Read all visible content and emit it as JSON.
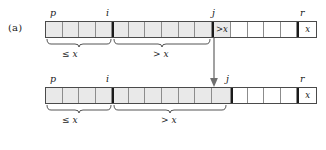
{
  "figure": {
    "part_label": "(a)",
    "caption_text": ""
  },
  "colors": {
    "shaded_cell": "#e9e9e9",
    "plain_cell": "#ffffff",
    "array_border": "#4a4a4a",
    "cell_divider": "#8c8c8c",
    "bold_divider": "#1a1a1a",
    "text": "#1a1a1a",
    "arrow": "#6f6f6f"
  },
  "top_array": {
    "name": "partition-state-before",
    "cells": [
      {
        "fill": "shaded",
        "text": ""
      },
      {
        "fill": "shaded",
        "text": ""
      },
      {
        "fill": "shaded",
        "text": ""
      },
      {
        "fill": "shaded",
        "text": ""
      },
      {
        "fill": "shaded",
        "text": ""
      },
      {
        "fill": "shaded",
        "text": ""
      },
      {
        "fill": "shaded",
        "text": ""
      },
      {
        "fill": "shaded",
        "text": ""
      },
      {
        "fill": "shaded",
        "text": ""
      },
      {
        "fill": "shaded",
        "text": ""
      },
      {
        "fill": "shaded",
        "text": ">x"
      },
      {
        "fill": "plain",
        "text": ""
      },
      {
        "fill": "plain",
        "text": ""
      },
      {
        "fill": "plain",
        "text": ""
      },
      {
        "fill": "plain",
        "text": ""
      },
      {
        "fill": "plain",
        "text": "x"
      }
    ],
    "labels": {
      "p": "p",
      "i": "i",
      "j": "j",
      "r": "r"
    },
    "braces": [
      {
        "label": "≤ x",
        "name": "brace-le-x"
      },
      {
        "label": "> x",
        "name": "brace-gt-x"
      }
    ]
  },
  "bottom_array": {
    "name": "partition-state-after",
    "cells": [
      {
        "fill": "shaded",
        "text": ""
      },
      {
        "fill": "shaded",
        "text": ""
      },
      {
        "fill": "shaded",
        "text": ""
      },
      {
        "fill": "shaded",
        "text": ""
      },
      {
        "fill": "shaded",
        "text": ""
      },
      {
        "fill": "shaded",
        "text": ""
      },
      {
        "fill": "shaded",
        "text": ""
      },
      {
        "fill": "shaded",
        "text": ""
      },
      {
        "fill": "shaded",
        "text": ""
      },
      {
        "fill": "shaded",
        "text": ""
      },
      {
        "fill": "shaded",
        "text": ""
      },
      {
        "fill": "plain",
        "text": ""
      },
      {
        "fill": "plain",
        "text": ""
      },
      {
        "fill": "plain",
        "text": ""
      },
      {
        "fill": "plain",
        "text": ""
      },
      {
        "fill": "plain",
        "text": "x"
      }
    ],
    "labels": {
      "p": "p",
      "i": "i",
      "j": "j",
      "r": "r"
    },
    "braces": [
      {
        "label": "≤ x",
        "name": "brace-le-x"
      },
      {
        "label": "> x",
        "name": "brace-gt-x"
      }
    ]
  },
  "arrow": {
    "name": "transition-arrow",
    "direction": "down"
  }
}
